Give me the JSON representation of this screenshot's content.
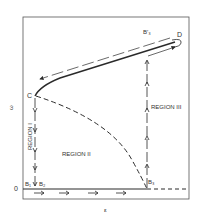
{
  "diagram": {
    "axes": {
      "y_label": "ω",
      "x_label": "ε",
      "origin_label": "0"
    },
    "points": {
      "C": "C",
      "D": "D",
      "B1": "B₁",
      "B2": "B₂",
      "B3": "B₃",
      "B3_prime": "B′₃"
    },
    "regions": {
      "region1": "REGION I",
      "region2": "REGION II",
      "region3": "REGION III"
    },
    "colors": {
      "line": "#2a2a2a",
      "frame": "#555555",
      "background": "#ffffff"
    }
  }
}
